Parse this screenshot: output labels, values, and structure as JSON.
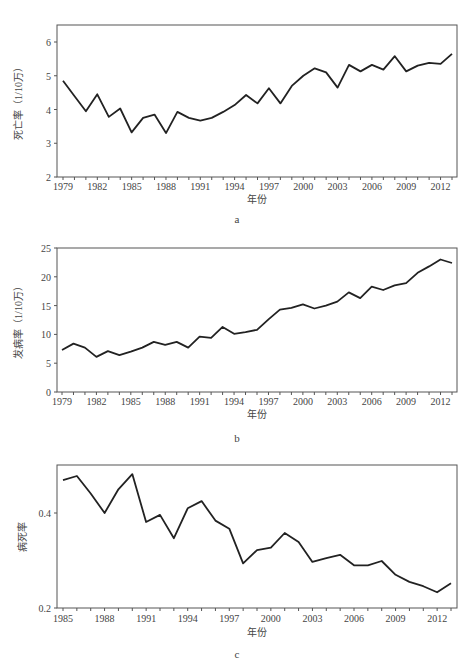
{
  "chart_data": [
    {
      "id": "a",
      "type": "line",
      "title": "",
      "caption": "a",
      "xlabel": "年份",
      "ylabel": "死亡率（1/10万）",
      "ylim": [
        2,
        6.5
      ],
      "yticks": [
        2,
        3,
        4,
        5,
        6
      ],
      "xtick_labels": [
        "1979",
        "1982",
        "1985",
        "1988",
        "1991",
        "1994",
        "1997",
        "2000",
        "2003",
        "2006",
        "2009",
        "2012"
      ],
      "grid": false,
      "legend": null,
      "x": [
        1979,
        1980,
        1981,
        1982,
        1983,
        1984,
        1985,
        1986,
        1987,
        1988,
        1989,
        1990,
        1991,
        1992,
        1993,
        1994,
        1995,
        1996,
        1997,
        1998,
        1999,
        2000,
        2001,
        2002,
        2003,
        2004,
        2005,
        2006,
        2007,
        2008,
        2009,
        2010,
        2011,
        2012,
        2013
      ],
      "series": [
        {
          "name": "死亡率",
          "values": [
            4.85,
            4.4,
            3.95,
            4.45,
            3.78,
            4.03,
            3.32,
            3.75,
            3.85,
            3.3,
            3.93,
            3.75,
            3.67,
            3.75,
            3.93,
            4.13,
            4.43,
            4.18,
            4.63,
            4.18,
            4.7,
            5.0,
            5.22,
            5.1,
            4.65,
            5.32,
            5.13,
            5.32,
            5.18,
            5.58,
            5.13,
            5.3,
            5.38,
            5.35,
            5.65
          ]
        }
      ]
    },
    {
      "id": "b",
      "type": "line",
      "title": "",
      "caption": "b",
      "xlabel": "年份",
      "ylabel": "发病率（1/10万）",
      "ylim": [
        0,
        25
      ],
      "yticks": [
        0,
        5,
        10,
        15,
        20,
        25
      ],
      "xtick_labels": [
        "1979",
        "1982",
        "1985",
        "1988",
        "1991",
        "1994",
        "1997",
        "2000",
        "2003",
        "2006",
        "2009",
        "2012"
      ],
      "grid": false,
      "legend": null,
      "x": [
        1979,
        1980,
        1981,
        1982,
        1983,
        1984,
        1985,
        1986,
        1987,
        1988,
        1989,
        1990,
        1991,
        1992,
        1993,
        1994,
        1995,
        1996,
        1997,
        1998,
        1999,
        2000,
        2001,
        2002,
        2003,
        2004,
        2005,
        2006,
        2007,
        2008,
        2009,
        2010,
        2011,
        2012,
        2013
      ],
      "series": [
        {
          "name": "发病率",
          "values": [
            7.3,
            8.4,
            7.7,
            6.1,
            7.1,
            6.4,
            7.0,
            7.7,
            8.7,
            8.2,
            8.7,
            7.7,
            9.6,
            9.4,
            11.3,
            10.1,
            10.4,
            10.8,
            12.6,
            14.3,
            14.6,
            15.2,
            14.5,
            15.0,
            15.7,
            17.3,
            16.3,
            18.3,
            17.7,
            18.5,
            18.9,
            20.7,
            21.8,
            23.0,
            22.4
          ]
        }
      ]
    },
    {
      "id": "c",
      "type": "line",
      "title": "",
      "caption": "c",
      "xlabel": "年份",
      "ylabel": "病死率",
      "ylim": [
        0.2,
        0.5
      ],
      "yticks": [
        0.2,
        0.4
      ],
      "xtick_labels": [
        "1985",
        "1988",
        "1991",
        "1994",
        "1997",
        "2000",
        "2003",
        "2006",
        "2009",
        "2012"
      ],
      "grid": false,
      "legend": null,
      "x": [
        1985,
        1986,
        1987,
        1988,
        1989,
        1990,
        1991,
        1992,
        1993,
        1994,
        1995,
        1996,
        1997,
        1998,
        1999,
        2000,
        2001,
        2002,
        2003,
        2004,
        2005,
        2006,
        2007,
        2008,
        2009,
        2010,
        2011,
        2012,
        2013
      ],
      "series": [
        {
          "name": "病死率",
          "values": [
            0.469,
            0.478,
            0.441,
            0.4,
            0.45,
            0.482,
            0.381,
            0.396,
            0.347,
            0.41,
            0.425,
            0.384,
            0.367,
            0.294,
            0.322,
            0.327,
            0.358,
            0.339,
            0.297,
            0.305,
            0.312,
            0.29,
            0.29,
            0.299,
            0.27,
            0.255,
            0.246,
            0.233,
            0.252
          ]
        }
      ]
    }
  ],
  "style": {
    "line_color": "#222222",
    "axis_color": "#555555",
    "text_color": "#444444"
  }
}
